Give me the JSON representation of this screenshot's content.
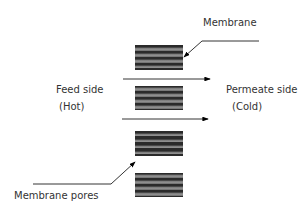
{
  "diagram": {
    "labels": {
      "membrane": "Membrane",
      "feed_side": "Feed side",
      "feed_temp": "(Hot)",
      "permeate_side": "Permeate side",
      "permeate_temp": "(Cold)",
      "membrane_pores": "Membrane pores"
    },
    "membrane_blocks": 4,
    "flow_arrows": 2,
    "colors": {
      "block": "#2a2a2a",
      "line": "#000000",
      "text": "#333333"
    }
  }
}
